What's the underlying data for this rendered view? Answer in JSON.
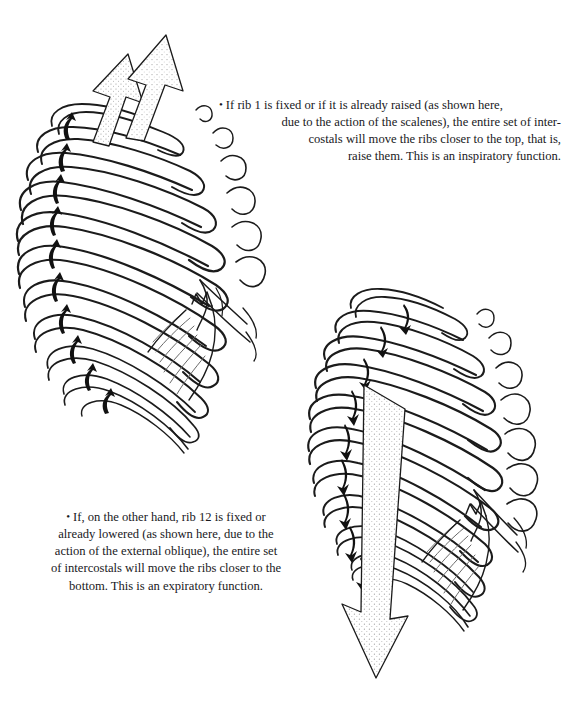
{
  "page": {
    "background_color": "#ffffff",
    "ink_color": "#19191c",
    "running_head": "· · · ·"
  },
  "captions": {
    "top": {
      "bullet": "•",
      "lines": [
        "If rib 1 is fixed or if it is already raised (as shown here,",
        "due to the action of the scalenes), the entire set of inter-",
        "costals will move the ribs closer to the top, that is,",
        "raise them. This is an inspiratory function."
      ],
      "full_text": "• If rib 1 is fixed or if it is already raised (as shown here, due to the action of the scalenes), the entire set of intercostals will move the ribs closer to the top, that is, raise them. This is an inspiratory function."
    },
    "bottom": {
      "bullet": "•",
      "lines": [
        "If, on the other hand, rib 12 is fixed or",
        "already lowered (as shown here, due to the",
        "action of the external oblique), the entire set",
        "of intercostals will move the ribs closer to the",
        "bottom. This is an expiratory function."
      ],
      "full_text": "• If, on the other hand, rib 12 is fixed or already lowered (as shown here, due to the action of the external oblique), the entire set of intercostals will move the ribs closer to the bottom. This is an expiratory function."
    }
  },
  "figures": {
    "top": {
      "name": "ribcage-inspiration",
      "description": "Oblique view of the thoracic rib cage with upward-pointing curved arrows between the ribs",
      "arrow_direction": "up",
      "rib_count": 12,
      "big_arrows": {
        "name": "scalene-traction-arrows",
        "count": 2,
        "direction": "up-right",
        "fill": "stipple",
        "label_meaning": "scalenes"
      },
      "small_arrows": {
        "name": "intercostal-arrows",
        "count": 10,
        "direction": "up",
        "fill": "#111111"
      }
    },
    "bottom": {
      "name": "ribcage-expiration",
      "description": "Oblique view of the thoracic rib cage with downward-pointing curved arrows between the ribs",
      "arrow_direction": "down",
      "rib_count": 12,
      "big_arrows": {
        "name": "external-oblique-traction-arrow",
        "count": 1,
        "direction": "down-left",
        "fill": "stipple",
        "label_meaning": "external oblique"
      },
      "small_arrows": {
        "name": "intercostal-arrows",
        "count": 9,
        "direction": "down",
        "fill": "#111111"
      }
    }
  }
}
